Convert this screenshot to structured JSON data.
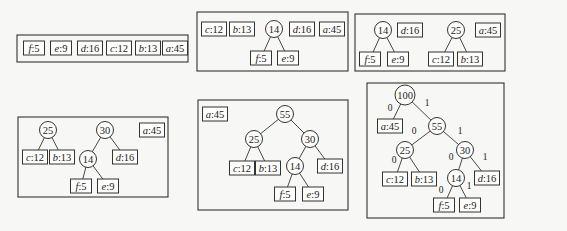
{
  "panels": [
    {
      "id": "step1",
      "box": [
        17,
        35,
        171,
        27
      ],
      "leaves": [
        {
          "ch": "f",
          "w": "5",
          "x": 34,
          "y": 48
        },
        {
          "ch": "e",
          "w": "9",
          "x": 61,
          "y": 48
        },
        {
          "ch": "d",
          "w": "16",
          "x": 90,
          "y": 48
        },
        {
          "ch": "c",
          "w": "12",
          "x": 119,
          "y": 48
        },
        {
          "ch": "b",
          "w": "13",
          "x": 148,
          "y": 48
        },
        {
          "ch": "a",
          "w": "45",
          "x": 175,
          "y": 48
        }
      ],
      "nodes": [],
      "edges": []
    },
    {
      "id": "step2",
      "box": [
        197,
        12,
        151,
        59
      ],
      "leaves": [
        {
          "ch": "c",
          "w": "12",
          "x": 214,
          "y": 29
        },
        {
          "ch": "b",
          "w": "13",
          "x": 242,
          "y": 29
        },
        {
          "ch": "d",
          "w": "16",
          "x": 302,
          "y": 29
        },
        {
          "ch": "a",
          "w": "45",
          "x": 332,
          "y": 29
        },
        {
          "ch": "f",
          "w": "5",
          "x": 261,
          "y": 58
        },
        {
          "ch": "e",
          "w": "9",
          "x": 288,
          "y": 58
        }
      ],
      "nodes": [
        {
          "w": "14",
          "x": 274,
          "y": 29
        }
      ],
      "edges": [
        {
          "x1": 274,
          "y1": 29,
          "x2": 261,
          "y2": 58,
          "bit": ""
        },
        {
          "x1": 274,
          "y1": 29,
          "x2": 288,
          "y2": 58,
          "bit": ""
        }
      ]
    },
    {
      "id": "step3",
      "box": [
        355,
        14,
        150,
        57
      ],
      "leaves": [
        {
          "ch": "d",
          "w": "16",
          "x": 410,
          "y": 30
        },
        {
          "ch": "a",
          "w": "45",
          "x": 488,
          "y": 30
        },
        {
          "ch": "f",
          "w": "5",
          "x": 370,
          "y": 59
        },
        {
          "ch": "e",
          "w": "9",
          "x": 398,
          "y": 59
        },
        {
          "ch": "c",
          "w": "12",
          "x": 441,
          "y": 59
        },
        {
          "ch": "b",
          "w": "13",
          "x": 470,
          "y": 59
        }
      ],
      "nodes": [
        {
          "w": "14",
          "x": 383,
          "y": 30
        },
        {
          "w": "25",
          "x": 456,
          "y": 30
        }
      ],
      "edges": [
        {
          "x1": 383,
          "y1": 30,
          "x2": 370,
          "y2": 59,
          "bit": ""
        },
        {
          "x1": 383,
          "y1": 30,
          "x2": 398,
          "y2": 59,
          "bit": ""
        },
        {
          "x1": 456,
          "y1": 30,
          "x2": 441,
          "y2": 59,
          "bit": ""
        },
        {
          "x1": 456,
          "y1": 30,
          "x2": 470,
          "y2": 59,
          "bit": ""
        }
      ]
    },
    {
      "id": "step4",
      "box": [
        18,
        117,
        150,
        80
      ],
      "leaves": [
        {
          "ch": "a",
          "w": "45",
          "x": 152,
          "y": 130
        },
        {
          "ch": "c",
          "w": "12",
          "x": 35,
          "y": 157
        },
        {
          "ch": "b",
          "w": "13",
          "x": 62,
          "y": 157
        },
        {
          "ch": "d",
          "w": "16",
          "x": 125,
          "y": 157
        },
        {
          "ch": "f",
          "w": "5",
          "x": 81,
          "y": 186
        },
        {
          "ch": "e",
          "w": "9",
          "x": 108,
          "y": 186
        }
      ],
      "nodes": [
        {
          "w": "25",
          "x": 48,
          "y": 130
        },
        {
          "w": "30",
          "x": 105,
          "y": 130
        },
        {
          "w": "14",
          "x": 88,
          "y": 159
        }
      ],
      "edges": [
        {
          "x1": 48,
          "y1": 130,
          "x2": 35,
          "y2": 157,
          "bit": ""
        },
        {
          "x1": 48,
          "y1": 130,
          "x2": 62,
          "y2": 157,
          "bit": ""
        },
        {
          "x1": 105,
          "y1": 130,
          "x2": 88,
          "y2": 159,
          "bit": ""
        },
        {
          "x1": 105,
          "y1": 130,
          "x2": 125,
          "y2": 157,
          "bit": ""
        },
        {
          "x1": 88,
          "y1": 159,
          "x2": 81,
          "y2": 186,
          "bit": ""
        },
        {
          "x1": 88,
          "y1": 159,
          "x2": 108,
          "y2": 186,
          "bit": ""
        }
      ]
    },
    {
      "id": "step5",
      "box": [
        198,
        100,
        150,
        110
      ],
      "leaves": [
        {
          "ch": "a",
          "w": "45",
          "x": 215,
          "y": 114
        },
        {
          "ch": "c",
          "w": "12",
          "x": 242,
          "y": 168
        },
        {
          "ch": "b",
          "w": "13",
          "x": 268,
          "y": 168
        },
        {
          "ch": "d",
          "w": "16",
          "x": 330,
          "y": 166
        },
        {
          "ch": "f",
          "w": "5",
          "x": 285,
          "y": 194
        },
        {
          "ch": "e",
          "w": "9",
          "x": 313,
          "y": 194
        }
      ],
      "nodes": [
        {
          "w": "55",
          "x": 285,
          "y": 114
        },
        {
          "w": "25",
          "x": 254,
          "y": 139
        },
        {
          "w": "30",
          "x": 310,
          "y": 139
        },
        {
          "w": "14",
          "x": 295,
          "y": 166
        }
      ],
      "edges": [
        {
          "x1": 285,
          "y1": 114,
          "x2": 254,
          "y2": 139,
          "bit": ""
        },
        {
          "x1": 285,
          "y1": 114,
          "x2": 310,
          "y2": 139,
          "bit": ""
        },
        {
          "x1": 254,
          "y1": 139,
          "x2": 242,
          "y2": 168,
          "bit": ""
        },
        {
          "x1": 254,
          "y1": 139,
          "x2": 268,
          "y2": 168,
          "bit": ""
        },
        {
          "x1": 310,
          "y1": 139,
          "x2": 295,
          "y2": 166,
          "bit": ""
        },
        {
          "x1": 310,
          "y1": 139,
          "x2": 330,
          "y2": 166,
          "bit": ""
        },
        {
          "x1": 295,
          "y1": 166,
          "x2": 285,
          "y2": 194,
          "bit": ""
        },
        {
          "x1": 295,
          "y1": 166,
          "x2": 313,
          "y2": 194,
          "bit": ""
        }
      ]
    },
    {
      "id": "step6",
      "box": [
        367,
        83,
        137,
        135
      ],
      "leaves": [
        {
          "ch": "a",
          "w": "45",
          "x": 390,
          "y": 126
        },
        {
          "ch": "c",
          "w": "12",
          "x": 395,
          "y": 179
        },
        {
          "ch": "b",
          "w": "13",
          "x": 424,
          "y": 179
        },
        {
          "ch": "d",
          "w": "16",
          "x": 487,
          "y": 178
        },
        {
          "ch": "f",
          "w": "5",
          "x": 444,
          "y": 205
        },
        {
          "ch": "e",
          "w": "9",
          "x": 470,
          "y": 205
        }
      ],
      "nodes": [
        {
          "w": "100",
          "x": 405,
          "y": 95
        },
        {
          "w": "55",
          "x": 437,
          "y": 126
        },
        {
          "w": "25",
          "x": 405,
          "y": 150
        },
        {
          "w": "30",
          "x": 465,
          "y": 150
        },
        {
          "w": "14",
          "x": 456,
          "y": 178
        }
      ],
      "edges": [
        {
          "x1": 405,
          "y1": 95,
          "x2": 390,
          "y2": 126,
          "bit": "0",
          "bx": 390,
          "by": 111
        },
        {
          "x1": 405,
          "y1": 95,
          "x2": 437,
          "y2": 126,
          "bit": "1",
          "bx": 427,
          "by": 106
        },
        {
          "x1": 437,
          "y1": 126,
          "x2": 405,
          "y2": 150,
          "bit": "0",
          "bx": 414,
          "by": 134
        },
        {
          "x1": 437,
          "y1": 126,
          "x2": 465,
          "y2": 150,
          "bit": "1",
          "bx": 460,
          "by": 134
        },
        {
          "x1": 405,
          "y1": 150,
          "x2": 395,
          "y2": 179,
          "bit": "0",
          "bx": 394,
          "by": 163
        },
        {
          "x1": 405,
          "y1": 150,
          "x2": 424,
          "y2": 179,
          "bit": "",
          "bx": 0,
          "by": 0
        },
        {
          "x1": 465,
          "y1": 150,
          "x2": 456,
          "y2": 178,
          "bit": "0",
          "bx": 451,
          "by": 160
        },
        {
          "x1": 465,
          "y1": 150,
          "x2": 487,
          "y2": 178,
          "bit": "1",
          "bx": 485,
          "by": 160
        },
        {
          "x1": 456,
          "y1": 178,
          "x2": 444,
          "y2": 205,
          "bit": "0",
          "bx": 441,
          "by": 193
        },
        {
          "x1": 456,
          "y1": 178,
          "x2": 470,
          "y2": 205,
          "bit": "1",
          "bx": 469,
          "by": 189
        }
      ]
    }
  ]
}
